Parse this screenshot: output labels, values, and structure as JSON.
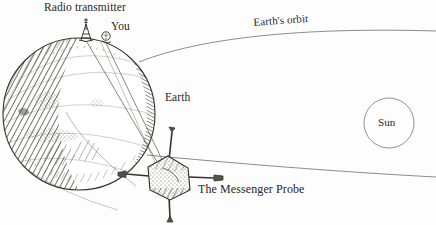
{
  "diagram": {
    "style": "hand-drawn pen-and-ink astronomy sketch",
    "background_color": "#fdfdfd",
    "ink_color": "#2a2724",
    "line_color": "#6b6b6b"
  },
  "labels": {
    "radio_transmitter": "Radio transmitter",
    "you": "You",
    "earth": "Earth",
    "earths_orbit": "Earth's orbit",
    "sun": "Sun",
    "messenger_probe": "The Messenger Probe"
  },
  "objects": {
    "earth": {
      "name": "Earth",
      "shape": "circle",
      "center_x": 79,
      "center_y": 114,
      "radius": 76,
      "fill": "hatched shading on left limb and lower right limb"
    },
    "sun": {
      "name": "Sun",
      "shape": "circle",
      "center_x": 389,
      "center_y": 123,
      "radius": 25,
      "fill": "none"
    },
    "probe": {
      "name": "The Messenger Probe",
      "shape": "cross-shaped spacecraft with four booms",
      "center_x": 168,
      "center_y": 178,
      "body_radius": 22
    },
    "transmitter": {
      "name": "Radio transmitter tower",
      "base_x": 85,
      "base_y": 40,
      "tip_x": 86,
      "tip_y": 18
    },
    "you_marker": {
      "name": "You",
      "center_x": 106,
      "center_y": 36,
      "radius": 4
    }
  },
  "orbit": {
    "name": "Earth's orbit",
    "upper_curve": "from Earth's right limb sweeping right and up, exiting at right edge",
    "lower_curve": "from Earth's lower right sweeping right and down, exiting at right edge"
  },
  "signal_beams": {
    "count": 2,
    "description": "two straight radio signal lines from the transmitter and You down to the Messenger Probe"
  }
}
